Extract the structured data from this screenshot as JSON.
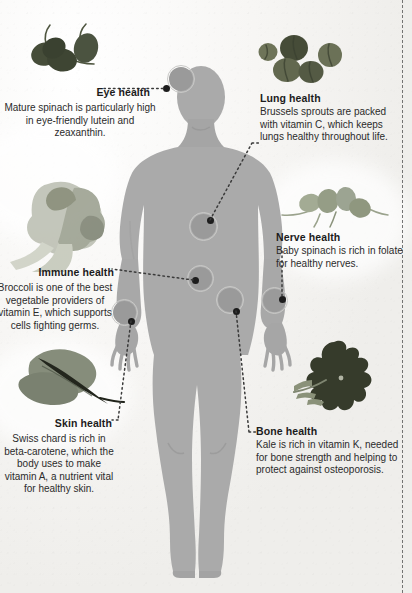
{
  "poster": {
    "title": "Leafy greens body health infographic",
    "background_color": "#f2f1ef",
    "figure_color": "#aaaaaa",
    "figure_shade_color": "#9b9b9b",
    "marker_color": "#8d8d8d",
    "marker_ring_color": "#c9c9c7",
    "anchor_dot_color": "#1d1d1d",
    "lead_line_color": "#3a3a3a",
    "heading_color": "#1c1c1c",
    "body_text_color": "#2b2b2b"
  },
  "callouts": [
    {
      "id": "eye",
      "heading": "Eye health",
      "body": "Mature spinach is particularly high in eye-friendly lutein and zeaxanthin.",
      "align": "center",
      "veg": "spinach-leaves",
      "veg_label": "mature spinach leaves",
      "veg_color": "#4a4f3c",
      "marker": {
        "x": 181,
        "y": 79,
        "size": 28
      },
      "anchor": {
        "x": 166,
        "y": 89
      }
    },
    {
      "id": "lung",
      "heading": "Lung health",
      "body": "Brussels sprouts are packed with vitamin C, which keeps lungs healthy throughout life.",
      "align": "left",
      "veg": "brussels-sprouts",
      "veg_label": "brussels sprouts",
      "veg_color": "#5a6048",
      "marker": {
        "x": 203,
        "y": 226,
        "size": 29
      },
      "anchor": {
        "x": 211,
        "y": 221
      }
    },
    {
      "id": "nerve",
      "heading": "Nerve health",
      "body": "Baby spinach is rich in folate for healthy nerves.",
      "align": "left",
      "veg": "baby-spinach",
      "veg_label": "baby spinach leaves",
      "veg_color": "#9aa38c",
      "marker": {
        "x": 274,
        "y": 300,
        "size": 27
      },
      "anchor": {
        "x": 281,
        "y": 300
      }
    },
    {
      "id": "immune",
      "heading": "Immune health",
      "body": "Broccoli is one of the best vegetable providers of vitamin E, which supports cells fighting germs.",
      "align": "center",
      "veg": "broccoli",
      "veg_label": "broccoli florets",
      "veg_color": "#b9bcae",
      "marker": {
        "x": 200,
        "y": 278,
        "size": 27
      },
      "anchor": {
        "x": 196,
        "y": 281
      }
    },
    {
      "id": "skin",
      "heading": "Skin health",
      "body": "Swiss chard is rich in beta-carotene, which the body uses to make vitamin A, a nutrient vital for healthy skin.",
      "align": "center",
      "veg": "swiss-chard",
      "veg_label": "swiss chard leaf",
      "veg_color": "#7d8476",
      "marker": {
        "x": 124,
        "y": 312,
        "size": 27
      },
      "anchor": {
        "x": 131,
        "y": 322
      }
    },
    {
      "id": "bone",
      "heading": "Bone health",
      "body": "Kale is rich in vitamin K, needed for bone strength and helping to protect against osteoporosis.",
      "align": "left",
      "veg": "kale",
      "veg_label": "kale leaf",
      "veg_color": "#3f4434",
      "marker": {
        "x": 230,
        "y": 300,
        "size": 28
      },
      "anchor": {
        "x": 237,
        "y": 312
      }
    }
  ]
}
